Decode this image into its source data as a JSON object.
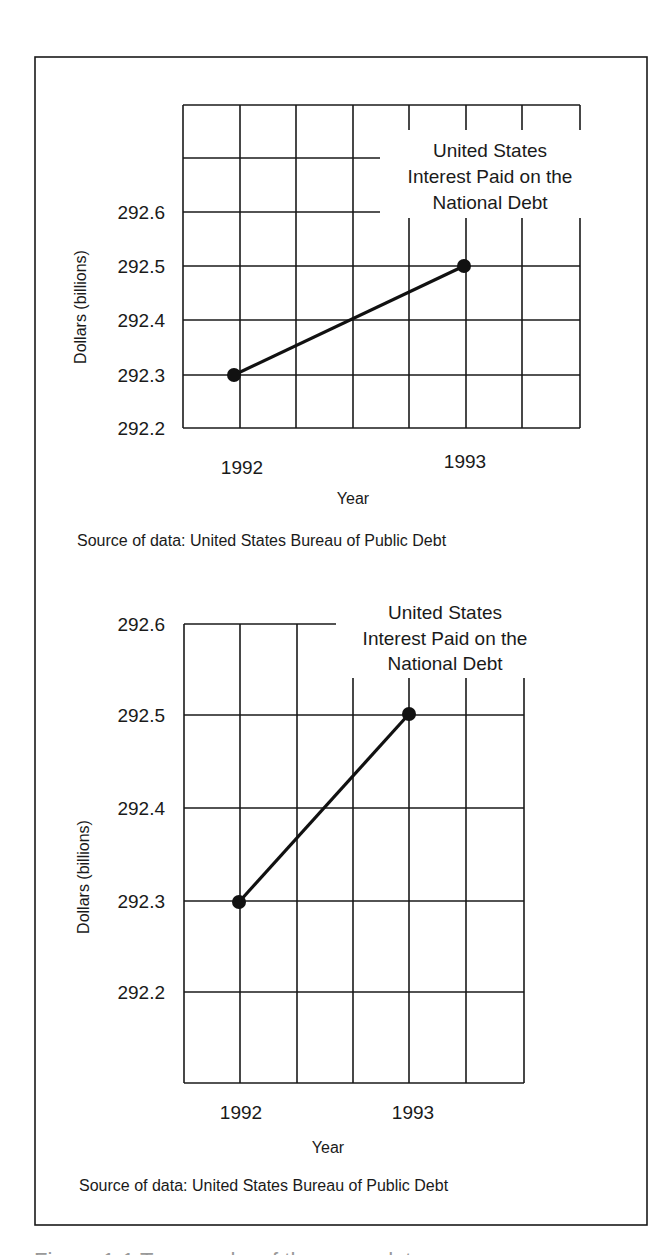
{
  "figure": {
    "frame": {
      "x": 35,
      "y": 57,
      "w": 612,
      "h": 1168
    },
    "caption_cut": "Figure 1-1 Two graphs of the same data"
  },
  "chart_data": [
    {
      "type": "line",
      "title": "United States Interest Paid on the National Debt",
      "title_lines": [
        "United States",
        "Interest Paid on the",
        "National Debt"
      ],
      "xlabel": "Year",
      "ylabel": "Dollars (billions)",
      "categories": [
        "1992",
        "1993"
      ],
      "values": [
        292.3,
        292.5
      ],
      "y_ticks": [
        "292.6",
        "292.5",
        "292.4",
        "292.3",
        "292.2"
      ],
      "ylim": [
        292.2,
        292.6
      ],
      "grid": true,
      "source": "Source of data: United States Bureau of Public Debt",
      "layout": {
        "grid_left": 183,
        "grid_right": 580,
        "grid_top": 105,
        "grid_bottom": 428,
        "cols": [
          183,
          240,
          296,
          353,
          409,
          466,
          522,
          580
        ],
        "rows": [
          105,
          158,
          212,
          266,
          320,
          375,
          428
        ],
        "y_tick_rows": [
          212,
          266,
          320,
          375,
          428
        ],
        "tick_label_x": 165,
        "points": [
          [
            234,
            375
          ],
          [
            464,
            266
          ]
        ],
        "mask": {
          "x": 380,
          "y": 130,
          "w": 205,
          "h": 88
        },
        "title_x": 490,
        "title_y": [
          150,
          176,
          202
        ],
        "ylabel_x": 80,
        "ylabel_y": 307,
        "xlabels": [
          [
            242,
            474
          ],
          [
            465,
            468
          ]
        ],
        "xlabel_pos": [
          353,
          504
        ],
        "source_pos": [
          77,
          546
        ]
      }
    },
    {
      "type": "line",
      "title": "United States Interest Paid on the National Debt",
      "title_lines": [
        "United States",
        "Interest Paid on the",
        "National Debt"
      ],
      "xlabel": "Year",
      "ylabel": "Dollars (billions)",
      "categories": [
        "1992",
        "1993"
      ],
      "values": [
        292.3,
        292.5
      ],
      "y_ticks": [
        "292.6",
        "292.5",
        "292.4",
        "292.3",
        "292.2"
      ],
      "ylim": [
        292.1,
        292.6
      ],
      "grid": true,
      "source": "Source of data: United States Bureau of Public Debt",
      "layout": {
        "grid_left": 184,
        "grid_right": 524,
        "grid_top": 624,
        "grid_bottom": 1083,
        "cols": [
          184,
          240,
          297,
          353,
          409,
          466,
          524
        ],
        "rows": [
          624,
          715,
          808,
          901,
          992,
          1083
        ],
        "y_tick_rows": [
          624,
          715,
          808,
          901,
          992
        ],
        "tick_label_x": 165,
        "points": [
          [
            239,
            902
          ],
          [
            409,
            714
          ]
        ],
        "mask": {
          "x": 336,
          "y": 596,
          "w": 200,
          "h": 82
        },
        "title_x": 445,
        "title_y": [
          612,
          638,
          663
        ],
        "ylabel_x": 83,
        "ylabel_y": 877,
        "xlabels": [
          [
            241,
            1119
          ],
          [
            413,
            1119
          ]
        ],
        "xlabel_pos": [
          328,
          1153
        ],
        "source_pos": [
          79,
          1191
        ]
      }
    }
  ]
}
